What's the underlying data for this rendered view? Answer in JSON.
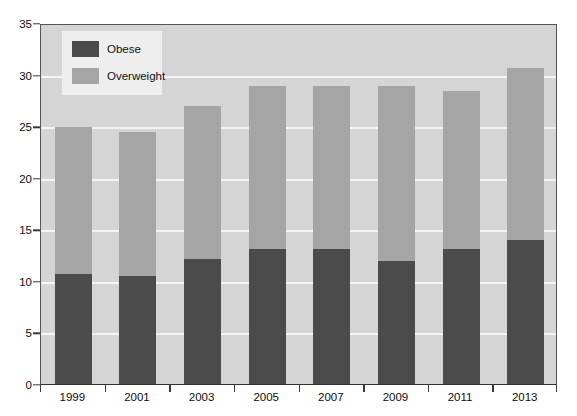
{
  "chart_data": {
    "type": "bar",
    "subtype": "stacked-vertical",
    "title": "",
    "subtitle": "",
    "xlabel": "",
    "ylabel": "",
    "categories": [
      "1999",
      "2001",
      "2003",
      "2005",
      "2007",
      "2009",
      "2011",
      "2013"
    ],
    "series": [
      {
        "name": "Obese",
        "color": "#4b4b4b",
        "values": [
          10.7,
          10.5,
          12.1,
          13.1,
          13.1,
          11.9,
          13.1,
          14.0
        ]
      },
      {
        "name": "Overweight",
        "color": "#a5a5a5",
        "values": [
          14.2,
          13.9,
          14.9,
          15.8,
          15.8,
          17.0,
          15.3,
          16.6
        ]
      }
    ],
    "totals": [
      24.9,
      24.4,
      27.0,
      28.9,
      28.9,
      28.9,
      28.4,
      30.6
    ],
    "ylim": [
      0,
      35
    ],
    "ytick_values": [
      0,
      5,
      10,
      15,
      20,
      25,
      30,
      35
    ],
    "ytick_labels": [
      "0",
      "5",
      "10",
      "15",
      "20",
      "25",
      "30",
      "35"
    ],
    "grid": true,
    "grid_axis": "y",
    "grid_color": "#f4f4f4",
    "legend_position": "upper-left",
    "legend_entries": [
      {
        "label": "Obese",
        "color": "#4b4b4b"
      },
      {
        "label": "Overweight",
        "color": "#a5a5a5"
      }
    ],
    "plot_background": "#d5d5d5",
    "figure_background": "#ffffff",
    "axis_color": "#3a3a3a"
  }
}
